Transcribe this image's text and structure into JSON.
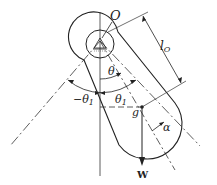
{
  "diagram": {
    "labels": {
      "pivot": "O",
      "length": "l",
      "length_sub": "O",
      "theta": "θ",
      "theta1_pos": "θ",
      "theta1_pos_sub": "1",
      "theta1_neg": "−θ",
      "theta1_neg_sub": "1",
      "cg": "g",
      "alpha": "α",
      "weight": "W"
    },
    "colors": {
      "stroke": "#222222",
      "background": "#ffffff"
    }
  }
}
